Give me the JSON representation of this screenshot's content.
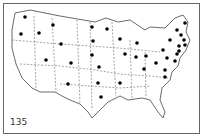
{
  "map": {
    "figure_number": "135",
    "subject": "United States outline map with state boundaries",
    "marker_color": "#000000",
    "markers": [
      {
        "x": 25,
        "y": 17
      },
      {
        "x": 21,
        "y": 34
      },
      {
        "x": 39,
        "y": 33
      },
      {
        "x": 53,
        "y": 25
      },
      {
        "x": 61,
        "y": 44
      },
      {
        "x": 46,
        "y": 60
      },
      {
        "x": 71,
        "y": 63
      },
      {
        "x": 68,
        "y": 84
      },
      {
        "x": 92,
        "y": 27
      },
      {
        "x": 93,
        "y": 41
      },
      {
        "x": 92,
        "y": 55
      },
      {
        "x": 99,
        "y": 67
      },
      {
        "x": 98,
        "y": 83
      },
      {
        "x": 101,
        "y": 97
      },
      {
        "x": 107,
        "y": 29
      },
      {
        "x": 120,
        "y": 39
      },
      {
        "x": 125,
        "y": 54
      },
      {
        "x": 120,
        "y": 83
      },
      {
        "x": 137,
        "y": 43
      },
      {
        "x": 136,
        "y": 57
      },
      {
        "x": 146,
        "y": 56
      },
      {
        "x": 156,
        "y": 63
      },
      {
        "x": 144,
        "y": 69
      },
      {
        "x": 165,
        "y": 70
      },
      {
        "x": 170,
        "y": 40
      },
      {
        "x": 163,
        "y": 50
      },
      {
        "x": 167,
        "y": 58
      },
      {
        "x": 165,
        "y": 77
      },
      {
        "x": 185,
        "y": 23
      },
      {
        "x": 177,
        "y": 30
      },
      {
        "x": 181,
        "y": 35
      },
      {
        "x": 184,
        "y": 40
      },
      {
        "x": 185,
        "y": 45
      },
      {
        "x": 179,
        "y": 46
      },
      {
        "x": 179,
        "y": 51
      },
      {
        "x": 177,
        "y": 54
      },
      {
        "x": 175,
        "y": 61
      }
    ]
  }
}
